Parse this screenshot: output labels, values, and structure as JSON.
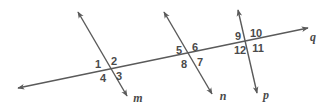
{
  "figure": {
    "background_color": "#ffffff",
    "stroke_color": "#5a5a5a",
    "text_color": "#4a4a4a",
    "width": 334,
    "height": 112
  },
  "lines": {
    "q": {
      "label": "q",
      "label_x": 313,
      "label_y": 38,
      "x1": 18,
      "y1": 88,
      "x2": 308,
      "y2": 28,
      "arrow_start": true,
      "arrow_end": true
    },
    "m": {
      "label": "m",
      "label_x": 138,
      "label_y": 99,
      "x1": 78,
      "y1": 12,
      "x2": 127,
      "y2": 96,
      "arrow_start": true,
      "arrow_end": true
    },
    "n": {
      "label": "n",
      "label_x": 223,
      "label_y": 97,
      "x1": 164,
      "y1": 12,
      "x2": 212,
      "y2": 94,
      "arrow_start": true,
      "arrow_end": true
    },
    "p": {
      "label": "p",
      "label_x": 266,
      "label_y": 96,
      "x1": 238,
      "y1": 10,
      "x2": 257,
      "y2": 93,
      "arrow_start": true,
      "arrow_end": true
    }
  },
  "intersections": [
    {
      "name": "intersection-m-q",
      "center_x": 108,
      "center_y": 68,
      "angles": [
        {
          "label": "1",
          "x": 98,
          "y": 65
        },
        {
          "label": "2",
          "x": 114,
          "y": 62
        },
        {
          "label": "3",
          "x": 119,
          "y": 77
        },
        {
          "label": "4",
          "x": 103,
          "y": 79
        }
      ]
    },
    {
      "name": "intersection-n-q",
      "center_x": 190,
      "center_y": 54,
      "angles": [
        {
          "label": "5",
          "x": 179,
          "y": 51
        },
        {
          "label": "6",
          "x": 195,
          "y": 48
        },
        {
          "label": "7",
          "x": 200,
          "y": 63
        },
        {
          "label": "8",
          "x": 184,
          "y": 65
        }
      ]
    },
    {
      "name": "intersection-p-q",
      "center_x": 248,
      "center_y": 42,
      "angles": [
        {
          "label": "9",
          "x": 238,
          "y": 37
        },
        {
          "label": "10",
          "x": 256,
          "y": 34
        },
        {
          "label": "11",
          "x": 258,
          "y": 49
        },
        {
          "label": "12",
          "x": 240,
          "y": 51
        }
      ]
    }
  ],
  "chart_data": {
    "type": "diagram",
    "parallel_lines": [
      "m",
      "n",
      "p"
    ],
    "transversal": "q",
    "angle_labels": [
      "1",
      "2",
      "3",
      "4",
      "5",
      "6",
      "7",
      "8",
      "9",
      "10",
      "11",
      "12"
    ],
    "angles_per_intersection": 4,
    "intersection_count": 3
  }
}
